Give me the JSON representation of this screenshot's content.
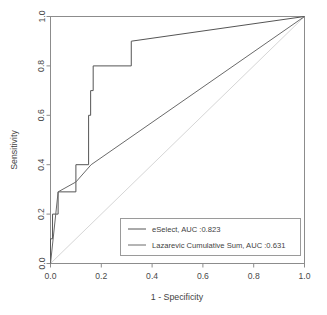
{
  "chart_data": {
    "type": "line",
    "title": "",
    "xlabel": "1 - Specificity",
    "ylabel": "Sensitivity",
    "xlim": [
      0,
      1
    ],
    "ylim": [
      0,
      1
    ],
    "grid": false,
    "legend_position": "bottom-right",
    "xticks": [
      "0.0",
      "0.2",
      "0.4",
      "0.6",
      "0.8",
      "1.0"
    ],
    "xtick_values": [
      0.0,
      0.2,
      0.4,
      0.6,
      0.8,
      1.0
    ],
    "yticks": [
      "0.0",
      "0.2",
      "0.4",
      "0.6",
      "0.8",
      "1.0"
    ],
    "ytick_values": [
      0.0,
      0.2,
      0.4,
      0.6,
      0.8,
      1.0
    ],
    "series": [
      {
        "name": "eSelect",
        "auc": 0.823,
        "legend_text": "eSelect, AUC :0.823",
        "color": "#555555",
        "style": "step",
        "points": [
          [
            0.0,
            0.0
          ],
          [
            0.0,
            0.1
          ],
          [
            0.008,
            0.1
          ],
          [
            0.008,
            0.2
          ],
          [
            0.03,
            0.2
          ],
          [
            0.03,
            0.29
          ],
          [
            0.1,
            0.29
          ],
          [
            0.1,
            0.4
          ],
          [
            0.15,
            0.4
          ],
          [
            0.15,
            0.6
          ],
          [
            0.158,
            0.6
          ],
          [
            0.158,
            0.7
          ],
          [
            0.168,
            0.7
          ],
          [
            0.168,
            0.8
          ],
          [
            0.195,
            0.8
          ],
          [
            0.195,
            0.8
          ],
          [
            0.318,
            0.8
          ],
          [
            0.318,
            0.9
          ],
          [
            1.0,
            1.0
          ]
        ]
      },
      {
        "name": "Lazarevic Cumulative Sum",
        "auc": 0.631,
        "legend_text": "Lazarevic Cumulative Sum, AUC :0.631",
        "color": "#6a6a6a",
        "style": "line",
        "points": [
          [
            0.0,
            0.0
          ],
          [
            0.03,
            0.29
          ],
          [
            0.1,
            0.33
          ],
          [
            0.16,
            0.4
          ],
          [
            1.0,
            1.0
          ]
        ]
      }
    ],
    "reference_line": {
      "name": "chance-diagonal",
      "color": "#d6d6d6",
      "points": [
        [
          0.0,
          0.0
        ],
        [
          1.0,
          1.0
        ]
      ]
    }
  },
  "axes": {
    "x_title": "1 - Specificity",
    "y_title": "Sensitivity"
  },
  "legend": {
    "entries": [
      {
        "label": "eSelect, AUC :0.823"
      },
      {
        "label": "Lazarevic Cumulative Sum, AUC :0.631"
      }
    ]
  }
}
